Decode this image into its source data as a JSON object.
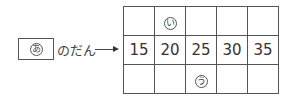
{
  "label": {
    "marker": "あ",
    "suffix": "のだん"
  },
  "grid": {
    "top": [
      "",
      "い",
      "",
      "",
      ""
    ],
    "middle": [
      "15",
      "20",
      "25",
      "30",
      "35"
    ],
    "bottom": [
      "",
      "",
      "う",
      "",
      ""
    ]
  }
}
